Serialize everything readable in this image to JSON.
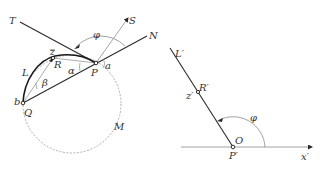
{
  "figure": {
    "left_diagram": {
      "labels": {
        "T": "T",
        "S": "S",
        "N": "N",
        "phi": "φ",
        "z": "z",
        "R": "R",
        "P": "P",
        "a": "a",
        "alpha": "α",
        "L": "L",
        "beta": "β",
        "b": "b",
        "Q": "Q",
        "M": "M"
      }
    },
    "right_diagram": {
      "labels": {
        "L_prime": "L′",
        "R_prime": "R′",
        "z_prime": "z′",
        "phi": "φ",
        "O": "O",
        "P_prime": "P′",
        "x_prime": "x′"
      }
    },
    "colors": {
      "line_dark": "#2a2a2a",
      "line_light": "#8a8a8a",
      "dashed": "#9a9a9a",
      "text": "#333333"
    }
  }
}
